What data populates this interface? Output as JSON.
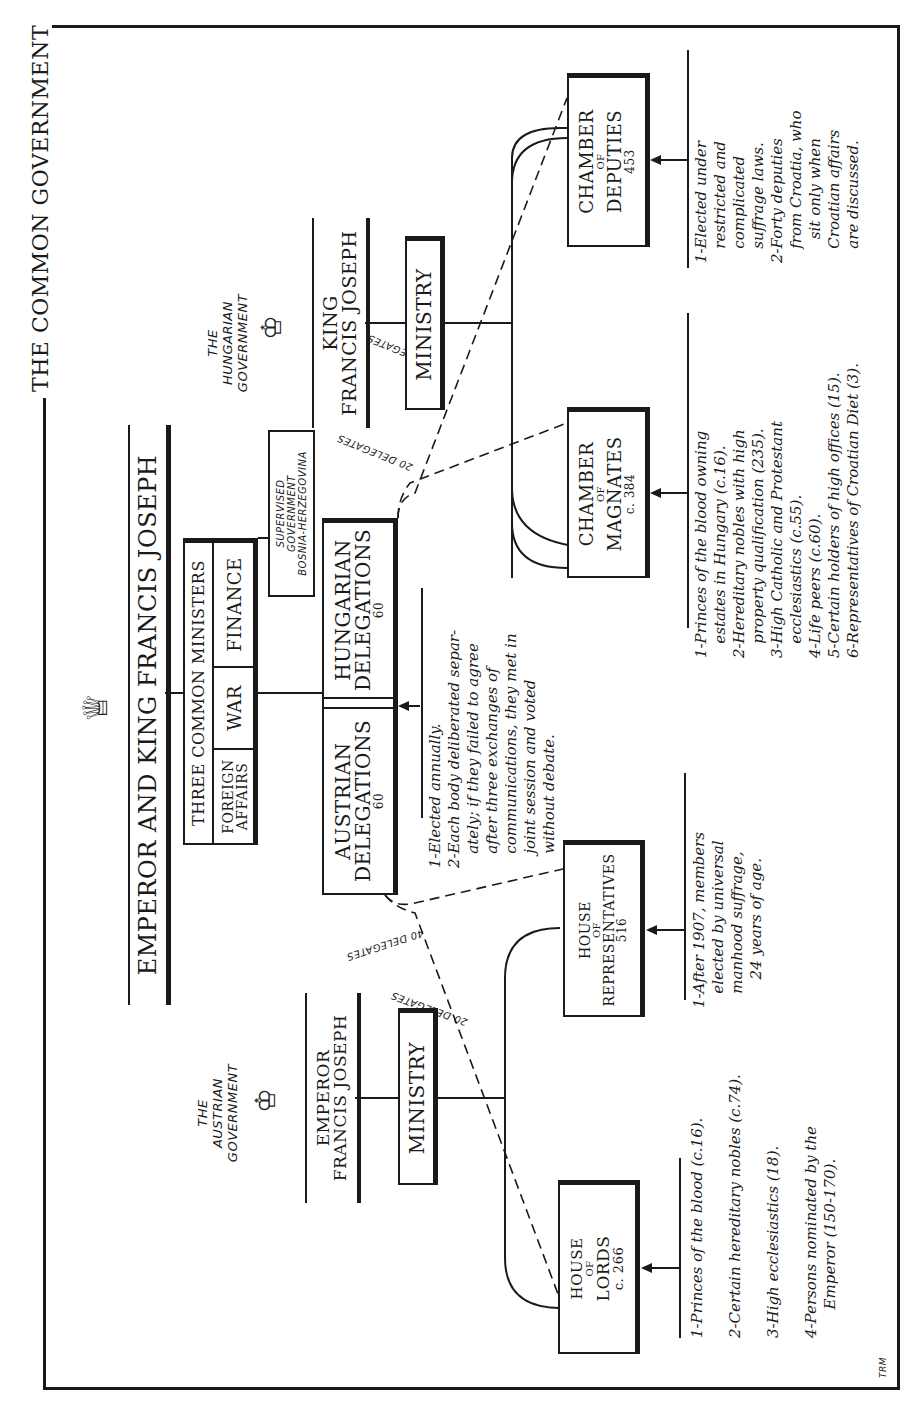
{
  "title": "THE COMMON GOVERNMENT",
  "emperor_header": "EMPEROR AND KING FRANCIS JOSEPH",
  "common_ministers": {
    "heading": "THREE COMMON MINISTERS",
    "items": [
      "FOREIGN AFFAIRS",
      "WAR",
      "FINANCE"
    ]
  },
  "supervised": {
    "line1": "SUPERVISED",
    "line2": "GOVERNMENT",
    "line3": "BOSNIA-HERZEGOVINA"
  },
  "delegations": {
    "austrian": {
      "line1": "AUSTRIAN",
      "line2": "DELEGATIONS",
      "count": "60"
    },
    "hungarian": {
      "line1": "HUNGARIAN",
      "line2": "DELEGATIONS",
      "count": "60"
    },
    "notes": [
      "1-Elected annually.",
      "2-Each body deliberated separ-",
      "   ately; if they failed to agree",
      "   after three exchanges of",
      "   communications, they met in",
      "   joint session and voted",
      "   without debate."
    ]
  },
  "hungarian_government": {
    "label_line1": "THE",
    "label_line2": "HUNGARIAN",
    "label_line3": "GOVERNMENT",
    "ruler_line1": "KING",
    "ruler_line2": "FRANCIS JOSEPH",
    "ministry": "MINISTRY",
    "delegates_to_deputies": "40 DELEGATES",
    "delegates_to_magnates": "20 DELEGATES",
    "chamber_of_magnates": {
      "line1": "CHAMBER",
      "line2": "OF",
      "line3": "MAGNATES",
      "count": "c. 384"
    },
    "chamber_of_deputies": {
      "line1": "CHAMBER",
      "line2": "OF",
      "line3": "DEPUTIES",
      "count": "453"
    },
    "magnates_notes": [
      "1-Princes of the blood owning",
      "   estates in Hungary (c.16).",
      "2-Hereditary nobles with high",
      "   property qualification (235).",
      "3-High Catholic and Protestant",
      "   ecclesiastics (c.55).",
      "4-Life peers (c.60).",
      "5-Certain holders of high offices (15).",
      "6-Representatives of Croatian Diet (3)."
    ],
    "deputies_notes": [
      "1-Elected under",
      "   restricted and",
      "   complicated",
      "   suffrage laws.",
      "2-Forty deputies",
      "   from Croatia, who",
      "     sit only when",
      "   Croatian affairs",
      "   are discussed."
    ]
  },
  "austrian_government": {
    "label_line1": "THE",
    "label_line2": "AUSTRIAN",
    "label_line3": "GOVERNMENT",
    "ruler_line1": "EMPEROR",
    "ruler_line2": "FRANCIS JOSEPH",
    "ministry": "MINISTRY",
    "delegates_to_representatives": "40 DELEGATES",
    "delegates_to_lords": "20 DELEGATES",
    "house_of_lords": {
      "line1": "HOUSE",
      "line2": "OF",
      "line3": "LORDS",
      "count": "c. 266"
    },
    "house_of_representatives": {
      "line1": "HOUSE",
      "line2": "OF",
      "line3": "REPRESENTATIVES",
      "count": "516"
    },
    "lords_notes": [
      "1-Princes of the blood (c.16).",
      "",
      "2-Certain hereditary nobles (c.74).",
      "",
      "3-High ecclesiastics (18).",
      "",
      "4-Persons nominated by the",
      "      Emperor (150-170)."
    ],
    "representatives_notes": [
      "1-After 1907, members",
      "   elected by universal",
      "   manhood suffrage,",
      "      24 years of age."
    ]
  },
  "signature": "TRM"
}
